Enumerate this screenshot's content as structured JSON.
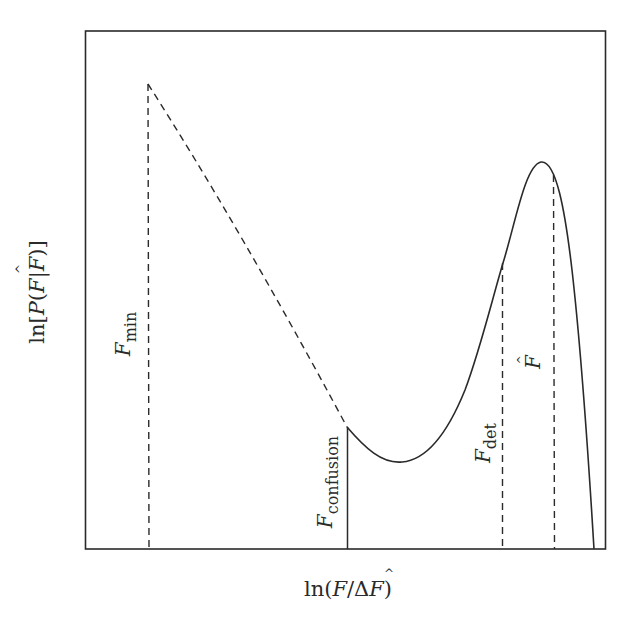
{
  "figure": {
    "y_axis_label": {
      "prefix": "ln[",
      "P": "P",
      "open": "(",
      "F": "F",
      "bar": "|",
      "Fhat": "F",
      "hat": "^",
      "close": ")]"
    },
    "x_axis_label": {
      "prefix": "ln(",
      "F": "F",
      "slash": "/",
      "delta": "Δ",
      "Fhat": "F",
      "hat": "^",
      "close": ")"
    },
    "markers": [
      {
        "id": "F_min",
        "symbol": "F",
        "subscript": "min",
        "line_style": "dashed"
      },
      {
        "id": "F_confusion",
        "symbol": "F",
        "subscript": "confusion",
        "line_style": "solid"
      },
      {
        "id": "F_det",
        "symbol": "F",
        "subscript": "det",
        "line_style": "dashed"
      },
      {
        "id": "F_hat",
        "symbol": "F",
        "hat": "^",
        "line_style": "dashed"
      }
    ],
    "curve": {
      "dashed_segment": "from F_min down to F_confusion (extrapolated power law)",
      "solid_segment": "from F_confusion through minimum, peak near F_hat, dropping to axis"
    },
    "colors": {
      "line": "#2a2a2a",
      "background": "#ffffff"
    }
  }
}
